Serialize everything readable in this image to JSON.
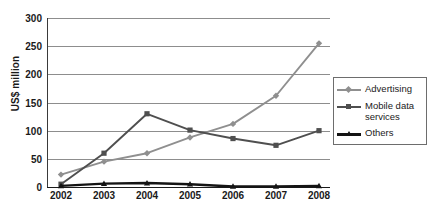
{
  "chart_data": {
    "type": "line",
    "title": "",
    "xlabel": "",
    "ylabel": "US$ million",
    "categories": [
      "2002",
      "2003",
      "2004",
      "2005",
      "2006",
      "2007",
      "2008"
    ],
    "x": [
      2002,
      2003,
      2004,
      2005,
      2006,
      2007,
      2008
    ],
    "ylim": [
      0,
      300
    ],
    "yticks": [
      0,
      50,
      100,
      150,
      200,
      250,
      300
    ],
    "ytick_labels": [
      "0",
      "50",
      "100",
      "150",
      "200",
      "250",
      "300"
    ],
    "grid": true,
    "grid_axis": "y",
    "legend_position": "right",
    "series": [
      {
        "name": "Advertising",
        "values": [
          22,
          45,
          60,
          88,
          112,
          162,
          255
        ],
        "color": "#8f8f8f",
        "marker": "diamond"
      },
      {
        "name": "Mobile data services",
        "values": [
          5,
          60,
          130,
          101,
          86,
          74,
          100
        ],
        "color": "#4f4f4f",
        "marker": "square"
      },
      {
        "name": "Others",
        "values": [
          2,
          6,
          7,
          5,
          1,
          1,
          2
        ],
        "color": "#141414",
        "marker": "triangle"
      }
    ]
  },
  "legend": {
    "entries": [
      {
        "label": "Advertising"
      },
      {
        "label": "Mobile data services"
      },
      {
        "label": "Others"
      }
    ]
  },
  "colors": {
    "advertising": "#8f8f8f",
    "mobile_data_services": "#4f4f4f",
    "others": "#141414",
    "gridline": "#8d8d8d",
    "axis": "#1a1a1a",
    "background": "#ffffff"
  }
}
